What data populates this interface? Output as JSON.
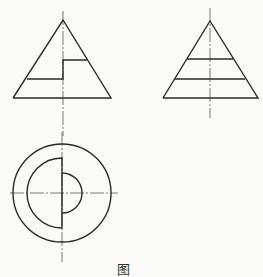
{
  "figure": {
    "caption": "图",
    "stroke_color": "#2a2a2a",
    "axis_color": "#555555",
    "background": "#fafaf8",
    "views": [
      {
        "name": "front-view",
        "shape": "cone-with-stepped-notch"
      },
      {
        "name": "side-view",
        "shape": "cone-with-two-cut-lines"
      },
      {
        "name": "top-view",
        "shape": "concentric-circles-with-half-disks"
      }
    ]
  }
}
